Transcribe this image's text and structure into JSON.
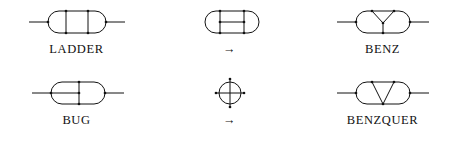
{
  "figure": {
    "background_color": "#ffffff",
    "line_color": "#111111",
    "text_color": "#111111",
    "columns": 3,
    "rows": 2
  },
  "cells": [
    {
      "id": "ladder",
      "icon": "stadium-two-rungs-with-leads-icon",
      "label": "LADDER",
      "description": "oval with two vertical rungs and external horizontal leads"
    },
    {
      "id": "arrow-top",
      "icon": "right-arrow-icon",
      "label": "→",
      "description": "rightward arrow"
    },
    {
      "id": "benz",
      "icon": "stadium-y-vertex-with-leads-icon",
      "label": "BENZ",
      "description": "oval with internal Y (three-point vertex) and external horizontal leads"
    },
    {
      "id": "bug",
      "icon": "stadium-tee-with-leads-icon",
      "label": "BUG",
      "description": "oval with one vertical rung and a horizontal bar to the left arc, plus external leads"
    },
    {
      "id": "arrow-bottom",
      "icon": "circle-crosshair-icon",
      "label": "→",
      "description": "circle with crossed horizontal and vertical lines; rightward arrow below"
    },
    {
      "id": "benzquer",
      "icon": "stadium-v-vertex-with-leads-icon",
      "label": "BENZQUER",
      "description": "oval with internal V joining the two top vertices at a lower vertex, plus external leads"
    }
  ],
  "labels": {
    "ladder": "LADDER",
    "arrow_top": "→",
    "benz": "BENZ",
    "bug": "BUG",
    "arrow_bottom": "→",
    "benzquer": "BENZQUER"
  }
}
